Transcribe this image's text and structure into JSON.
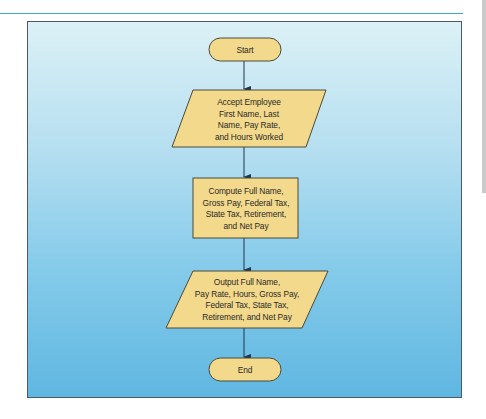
{
  "colors": {
    "rule": "#3fa9d6",
    "panel_top": "#dcf1f6",
    "panel_bottom": "#5fb7e1",
    "shape_fill": "#f3d98b",
    "shape_stroke": "#4a4a3a",
    "arrow": "#1f3550",
    "text": "#2a2a2a"
  },
  "flowchart": {
    "nodes": [
      {
        "id": "start",
        "type": "terminal",
        "label": "Start"
      },
      {
        "id": "input",
        "type": "input-output",
        "lines": [
          "Accept Employee",
          "First Name, Last",
          "Name, Pay Rate,",
          "and Hours Worked"
        ]
      },
      {
        "id": "compute",
        "type": "process",
        "lines": [
          "Compute Full Name,",
          "Gross Pay, Federal Tax,",
          "State Tax, Retirement,",
          "and Net Pay"
        ]
      },
      {
        "id": "output",
        "type": "input-output",
        "lines": [
          "Output Full Name,",
          "Pay Rate, Hours, Gross Pay,",
          "Federal Tax, State Tax,",
          "Retirement, and Net Pay"
        ]
      },
      {
        "id": "end",
        "type": "terminal",
        "label": "End"
      }
    ],
    "edges": [
      {
        "from": "start",
        "to": "input"
      },
      {
        "from": "input",
        "to": "compute"
      },
      {
        "from": "compute",
        "to": "output"
      },
      {
        "from": "output",
        "to": "end"
      }
    ]
  }
}
